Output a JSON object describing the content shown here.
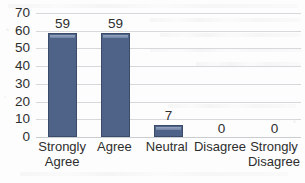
{
  "chart_data": {
    "type": "bar",
    "title": "",
    "xlabel": "",
    "ylabel": "",
    "categories": [
      "Strongly Agree",
      "Agree",
      "Neutral",
      "Disagree",
      "Strongly Disagree"
    ],
    "values": [
      59,
      59,
      7,
      0,
      0
    ],
    "data_labels": [
      "59",
      "59",
      "7",
      "0",
      "0"
    ],
    "ylim": [
      0,
      70
    ],
    "ytick_labels": [
      "70",
      "60",
      "50",
      "40",
      "30",
      "20",
      "10",
      "0"
    ],
    "ytick_values": [
      70,
      60,
      50,
      40,
      30,
      20,
      10,
      0
    ],
    "ytick_interval": 10,
    "grid": "horizontal",
    "legend": "none",
    "bar_color": "#4F6389",
    "bar_outline_color": "#3B4C6B",
    "bar_highlight_color": "#97A6C0",
    "gridline_color": "#D6D8DC",
    "text_color": "#2E2E2E",
    "background_color": "#FDFDFD"
  },
  "axis": {
    "y_ticks": [
      {
        "label": "70"
      },
      {
        "label": "60"
      },
      {
        "label": "50"
      },
      {
        "label": "40"
      },
      {
        "label": "30"
      },
      {
        "label": "20"
      },
      {
        "label": "10"
      },
      {
        "label": "0"
      }
    ],
    "x_categories": [
      {
        "label": "Strongly\nAgree"
      },
      {
        "label": "Agree"
      },
      {
        "label": "Neutral"
      },
      {
        "label": "Disagree"
      },
      {
        "label": "Strongly\nDisagree"
      }
    ]
  },
  "bars": [
    {
      "label": "59",
      "value": 59
    },
    {
      "label": "59",
      "value": 59
    },
    {
      "label": "7",
      "value": 7
    },
    {
      "label": "0",
      "value": 0
    },
    {
      "label": "0",
      "value": 0
    }
  ]
}
